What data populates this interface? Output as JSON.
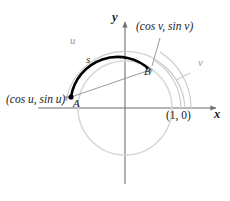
{
  "figure": {
    "width": 230,
    "height": 201,
    "background_color": "#ffffff"
  },
  "colors": {
    "axis": "#6f6f6f",
    "circle": "#d8d8d8",
    "outer_arc": "#c9c9c9",
    "bold_arc": "#000000",
    "chord": "#8f8f8f",
    "point_a": "#000000",
    "point_b": "#b5b5b5",
    "text_dark": "#1a1a1a",
    "text_gray": "#9a9a9a"
  },
  "labels": {
    "coord_a": "(cos u, sin u)",
    "coord_b": "(cos v, sin v)",
    "point_one_zero": "(1, 0)",
    "x_axis": "x",
    "y_axis": "y",
    "point_a": "A",
    "point_b": "B",
    "arc_s": "s",
    "arc_u": "u",
    "arc_v": "v"
  },
  "geometry": {
    "center_x": 125,
    "center_y": 108,
    "unit_radius": 47,
    "point_a_x": 71,
    "point_a_y": 97,
    "point_b_x": 150,
    "point_b_y": 70,
    "arc_u_radius": 60,
    "arc_v_radius": 56,
    "arc_v_outer_radius": 66
  }
}
